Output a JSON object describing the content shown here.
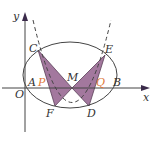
{
  "diagram": {
    "type": "conic-geometry",
    "colors": {
      "line": "#444444",
      "shade": "#a3789e",
      "shade_stroke": "#5a4058",
      "accent_label": "#e07a3c",
      "label": "#333333"
    },
    "axes": {
      "x_label": "x",
      "y_label": "y",
      "origin_label": "O"
    },
    "points": [
      {
        "name": "A",
        "label": "A",
        "x": 27,
        "y": 88,
        "lx": 28,
        "ly": 86,
        "accent": false
      },
      {
        "name": "P",
        "label": "P",
        "x": 45,
        "y": 88,
        "lx": 38,
        "ly": 86,
        "accent": true
      },
      {
        "name": "M",
        "label": "M",
        "x": 72,
        "y": 88,
        "lx": 67,
        "ly": 81,
        "accent": false
      },
      {
        "name": "Q",
        "label": "Q",
        "x": 100,
        "y": 88,
        "lx": 96,
        "ly": 86,
        "accent": true
      },
      {
        "name": "B",
        "label": "B",
        "x": 117,
        "y": 88,
        "lx": 113,
        "ly": 86,
        "accent": false
      },
      {
        "name": "C",
        "label": "C",
        "x": 38,
        "y": 50,
        "lx": 29,
        "ly": 52,
        "accent": false
      },
      {
        "name": "E",
        "label": "E",
        "x": 105,
        "y": 55,
        "lx": 105,
        "ly": 53,
        "accent": false
      },
      {
        "name": "F",
        "label": "F",
        "x": 55,
        "y": 106,
        "lx": 46,
        "ly": 117,
        "accent": false
      },
      {
        "name": "D",
        "label": "D",
        "x": 89,
        "y": 106,
        "lx": 87,
        "ly": 117,
        "accent": false
      }
    ]
  }
}
